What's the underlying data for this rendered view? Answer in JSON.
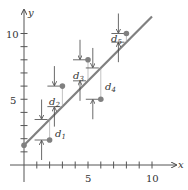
{
  "chart_data": {
    "type": "scatter",
    "title": "",
    "xlabel": "x",
    "ylabel": "y",
    "xlim": [
      0,
      11
    ],
    "ylim": [
      0,
      11
    ],
    "x_ticks": [
      1,
      2,
      3,
      4,
      5,
      6,
      7,
      8,
      9,
      10
    ],
    "y_ticks": [
      1,
      2,
      3,
      4,
      5,
      6,
      7,
      8,
      9,
      10
    ],
    "x_tick_labels": {
      "5": "5",
      "10": "10"
    },
    "y_tick_labels": {
      "5": "5",
      "10": "10"
    },
    "points": [
      {
        "x": 2,
        "y": 1.9
      },
      {
        "x": 3,
        "y": 6
      },
      {
        "x": 5,
        "y": 8
      },
      {
        "x": 6,
        "y": 5
      },
      {
        "x": 8,
        "y": 10
      }
    ],
    "fit_line": {
      "x0": 0,
      "y0": 1.5,
      "x1": 10,
      "y1": 11.3
    },
    "deviation_labels": [
      "d1",
      "d2",
      "d3",
      "d4",
      "d5"
    ],
    "grid": false,
    "colors": {
      "line": "#808080",
      "point": "#808080",
      "axis": "#444444"
    }
  },
  "labels": {
    "x_axis": "x",
    "y_axis": "y",
    "tick_5": "5",
    "tick_10": "10",
    "d1": "d",
    "d1_sub": "1",
    "d2": "d",
    "d2_sub": "2",
    "d3": "d",
    "d3_sub": "3",
    "d4": "d",
    "d4_sub": "4",
    "d5": "d",
    "d5_sub": "5"
  }
}
